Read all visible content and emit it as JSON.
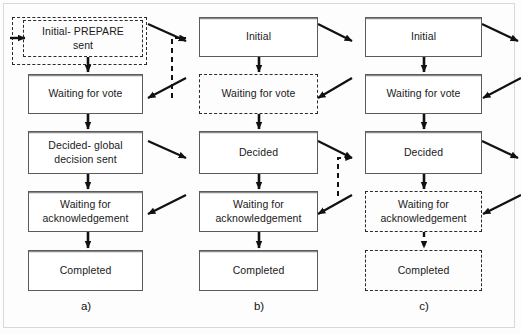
{
  "figure": {
    "type": "state-transition-diagram",
    "columns": [
      {
        "id": "a",
        "caption": "a)",
        "nodes": [
          {
            "id": "a1",
            "label": "Initial- PREPARE\nsent",
            "line1": "Initial- PREPARE",
            "line2": "sent",
            "style": "dashed"
          },
          {
            "id": "a2",
            "label": "Waiting for vote",
            "line1": "Waiting for vote",
            "line2": "",
            "style": "solid"
          },
          {
            "id": "a3",
            "label": "Decided- global\ndecision sent",
            "line1": "Decided- global",
            "line2": "decision sent",
            "style": "solid"
          },
          {
            "id": "a4",
            "label": "Waiting for\nacknowledgement",
            "line1": "Waiting for",
            "line2": "acknowledgement",
            "style": "solid"
          },
          {
            "id": "a5",
            "label": "Completed",
            "line1": "Completed",
            "line2": "",
            "style": "solid"
          }
        ]
      },
      {
        "id": "b",
        "caption": "b)",
        "nodes": [
          {
            "id": "b1",
            "label": "Initial",
            "line1": "Initial",
            "line2": "",
            "style": "solid"
          },
          {
            "id": "b2",
            "label": "Waiting for vote",
            "line1": "Waiting for vote",
            "line2": "",
            "style": "dashed"
          },
          {
            "id": "b3",
            "label": "Decided",
            "line1": "Decided",
            "line2": "",
            "style": "solid"
          },
          {
            "id": "b4",
            "label": "Waiting for\nacknowledgement",
            "line1": "Waiting for",
            "line2": "acknowledgement",
            "style": "solid"
          },
          {
            "id": "b5",
            "label": "Completed",
            "line1": "Completed",
            "line2": "",
            "style": "solid"
          }
        ]
      },
      {
        "id": "c",
        "caption": "c)",
        "nodes": [
          {
            "id": "c1",
            "label": "Initial",
            "line1": "Initial",
            "line2": "",
            "style": "solid"
          },
          {
            "id": "c2",
            "label": "Waiting for vote",
            "line1": "Waiting for vote",
            "line2": "",
            "style": "solid"
          },
          {
            "id": "c3",
            "label": "Decided",
            "line1": "Decided",
            "line2": "",
            "style": "solid"
          },
          {
            "id": "c4",
            "label": "Waiting for\nacknowledgement",
            "line1": "Waiting for",
            "line2": "acknowledgement",
            "style": "dashed"
          },
          {
            "id": "c5",
            "label": "Completed",
            "line1": "Completed",
            "line2": "",
            "style": "dashed"
          }
        ]
      }
    ],
    "colors": {
      "box_border_solid": "#5b5b5b",
      "box_border_dashed": "#2b2b2b",
      "arrow": "#111111",
      "frame": "#d9d9d9",
      "background": "#fdfdfd",
      "text": "#1a1a1a"
    },
    "edges": [
      {
        "from": "a1",
        "to": "a2",
        "style": "solid",
        "direction": "down"
      },
      {
        "from": "a2",
        "to": "a3",
        "style": "solid",
        "direction": "down"
      },
      {
        "from": "a3",
        "to": "a4",
        "style": "solid",
        "direction": "down"
      },
      {
        "from": "a4",
        "to": "a5",
        "style": "solid",
        "direction": "down"
      },
      {
        "from": "b1",
        "to": "b2",
        "style": "solid",
        "direction": "down"
      },
      {
        "from": "b2",
        "to": "b3",
        "style": "solid",
        "direction": "down"
      },
      {
        "from": "b3",
        "to": "b4",
        "style": "solid",
        "direction": "down"
      },
      {
        "from": "b4",
        "to": "b5",
        "style": "solid",
        "direction": "down"
      },
      {
        "from": "c1",
        "to": "c2",
        "style": "solid",
        "direction": "down"
      },
      {
        "from": "c2",
        "to": "c3",
        "style": "solid",
        "direction": "down"
      },
      {
        "from": "c3",
        "to": "c4",
        "style": "solid",
        "direction": "down"
      },
      {
        "from": "c4",
        "to": "c5",
        "style": "dashed",
        "direction": "down"
      },
      {
        "from": "a1",
        "to": "b1",
        "style": "solid",
        "direction": "diagonal-right"
      },
      {
        "from": "b2",
        "to": "a2",
        "style": "solid",
        "direction": "diagonal-left"
      },
      {
        "from": "a3",
        "to": "b3",
        "style": "solid",
        "direction": "diagonal-right"
      },
      {
        "from": "b4",
        "to": "a4",
        "style": "solid",
        "direction": "diagonal-left"
      },
      {
        "from": "b1",
        "to": "c1",
        "style": "solid",
        "direction": "diagonal-right"
      },
      {
        "from": "c2",
        "to": "b2",
        "style": "solid",
        "direction": "diagonal-left"
      },
      {
        "from": "b3",
        "to": "c3",
        "style": "solid",
        "direction": "diagonal-right"
      },
      {
        "from": "c4",
        "to": "b4",
        "style": "solid",
        "direction": "diagonal-left"
      },
      {
        "from": "c1",
        "to": "offpage-right",
        "style": "solid",
        "direction": "diagonal-right"
      },
      {
        "from": "offpage-right",
        "to": "c2",
        "style": "solid",
        "direction": "diagonal-left"
      },
      {
        "from": "c3",
        "to": "offpage-right",
        "style": "solid",
        "direction": "diagonal-right"
      },
      {
        "from": "offpage-right",
        "to": "c4",
        "style": "solid",
        "direction": "diagonal-left"
      },
      {
        "from": "offpage-left",
        "to": "a1",
        "style": "solid",
        "direction": "right"
      },
      {
        "from": "b2-dashed-region",
        "to": "b1",
        "style": "dashed",
        "direction": "up"
      },
      {
        "from": "c4-dashed-region",
        "to": "c3",
        "style": "dashed",
        "direction": "up"
      }
    ]
  }
}
